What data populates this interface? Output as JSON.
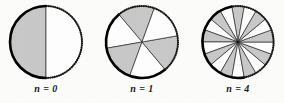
{
  "figure": {
    "type": "diagram",
    "background_color": "#fdfdfc",
    "ink_color": "#111111",
    "shaded_sector_color": "#c9c9c9",
    "unshaded_sector_color": "#ffffff",
    "solid_arc_color": "#000000",
    "dotted_arc_color": "#1a1a1a",
    "radius_px": 36,
    "panels": [
      {
        "id": "panel-n0",
        "label": "n = 0",
        "n": 0,
        "sector_count": 2,
        "shaded_sector_count": 1,
        "unshaded_sector_count": 1,
        "sector_angle_deg": 180,
        "start_angle_deg": 90,
        "solid_arc_start_deg": 90,
        "solid_arc_sweep_deg": 180,
        "dotted_arc_start_deg": 270,
        "dotted_arc_sweep_deg": 180
      },
      {
        "id": "panel-n1",
        "label": "n = 1",
        "n": 1,
        "sector_count": 6,
        "shaded_sector_count": 3,
        "unshaded_sector_count": 3,
        "sector_angle_deg": 60,
        "start_angle_deg": 70,
        "solid_arc_start_deg": 130,
        "solid_arc_sweep_deg": 180,
        "dotted_arc_start_deg": 310,
        "dotted_arc_sweep_deg": 180
      },
      {
        "id": "panel-n4",
        "label": "n = 4",
        "n": 4,
        "sector_count": 18,
        "shaded_sector_count": 9,
        "unshaded_sector_count": 9,
        "sector_angle_deg": 20,
        "start_angle_deg": 80,
        "solid_arc_start_deg": 100,
        "solid_arc_sweep_deg": 180,
        "dotted_arc_start_deg": 280,
        "dotted_arc_sweep_deg": 180
      }
    ]
  }
}
